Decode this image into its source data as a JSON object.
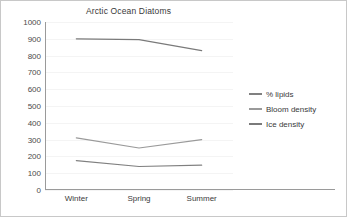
{
  "chart_data": {
    "type": "line",
    "title": "Arctic Ocean Diatoms",
    "xlabel": "",
    "ylabel": "",
    "categories": [
      "Winter",
      "Spring",
      "Summer"
    ],
    "ylim": [
      0,
      1000
    ],
    "y_ticks": [
      0,
      100,
      200,
      300,
      400,
      500,
      600,
      700,
      800,
      900,
      1000
    ],
    "y_tick_labels": [
      "0",
      "100",
      "200",
      "300",
      "400",
      "500",
      "600",
      "700",
      "800",
      "900",
      "1000"
    ],
    "grid": true,
    "legend_position": "right",
    "series": [
      {
        "name": "% lipids",
        "values": [
          175,
          140,
          148
        ],
        "color": "#808080"
      },
      {
        "name": "Bloom density",
        "values": [
          310,
          250,
          300
        ],
        "color": "#9a9a9a"
      },
      {
        "name": "Ice density",
        "values": [
          900,
          895,
          830
        ],
        "color": "#7a7a7a"
      }
    ]
  },
  "legend": {
    "items": [
      {
        "label": "% lipids"
      },
      {
        "label": "Bloom density"
      },
      {
        "label": "Ice density"
      }
    ]
  }
}
